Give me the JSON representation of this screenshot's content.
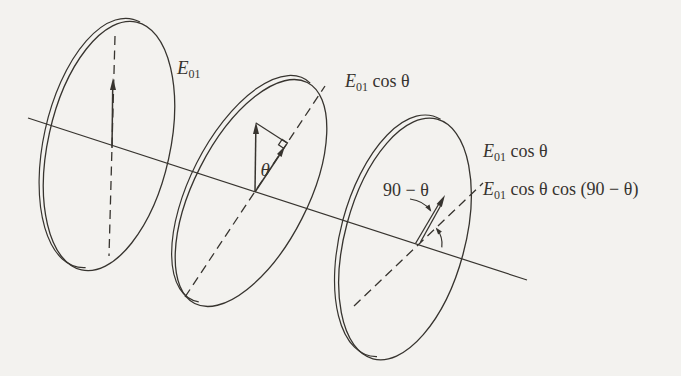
{
  "colors": {
    "ink": "#37342f",
    "paper": "#f3f2ef"
  },
  "labels": {
    "disk1_field": {
      "base": "E",
      "sub": "01",
      "rest": ""
    },
    "disk2_field": {
      "base": "E",
      "sub": "01",
      "rest": " cos θ"
    },
    "disk3_field": {
      "base": "E",
      "sub": "01",
      "rest": " cos θ"
    },
    "disk3_transmitted": {
      "base": "E",
      "sub": "01",
      "rest": " cos θ cos (90 − θ)"
    },
    "disk2_angle": "θ",
    "disk3_angle": "90 − θ"
  }
}
